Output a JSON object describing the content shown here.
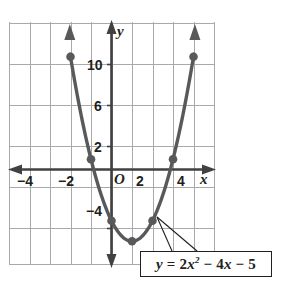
{
  "figure": {
    "kind": "coordinate-plane-graph",
    "background_color": "#ffffff",
    "grid_color": "#a7a9ac",
    "axis_color": "#414042",
    "curve_color": "#58595b",
    "point_color": "#58595b",
    "label_color": "#231f20"
  },
  "axes": {
    "x_axis_name": "x",
    "y_axis_name": "y",
    "origin_label": "O",
    "x_ticks": [
      {
        "label": "−4",
        "value": -4
      },
      {
        "label": "−2",
        "value": -2
      },
      {
        "label": "2",
        "value": 2
      },
      {
        "label": "4",
        "value": 4
      }
    ],
    "y_ticks": [
      {
        "label": "10",
        "value": 10
      },
      {
        "label": "6",
        "value": 6
      },
      {
        "label": "2",
        "value": 2
      },
      {
        "label": "−4",
        "value": -4
      }
    ]
  },
  "callout": {
    "equation_plain": "y = 2x² − 4x − 5",
    "lhs": "y",
    "equals": "=",
    "coef_a": "2",
    "var_x": "x",
    "exponent": "2",
    "minus_one": "−",
    "coef_b": "4",
    "var_x2": "x",
    "minus_two": "−",
    "constant": "5"
  },
  "chart_data": {
    "type": "line",
    "title": "",
    "xlabel": "x",
    "ylabel": "y",
    "xlim": [
      -5,
      5
    ],
    "ylim": [
      -8,
      12
    ],
    "grid": true,
    "legend": "none",
    "annotations": [
      {
        "text": "y = 2x² − 4x − 5",
        "kind": "equation-callout-box",
        "points_to": [
          [
            2.25,
            -5.2
          ],
          [
            2.25,
            -5.2
          ]
        ]
      }
    ],
    "series": [
      {
        "name": "y = 2x² − 4x − 5",
        "type": "parabola",
        "equation": "y = 2x^2 - 4x - 5",
        "a": 2,
        "b": -4,
        "c": -5,
        "vertex": [
          1,
          -7
        ],
        "x": [
          -2,
          -1,
          0,
          1,
          2,
          3,
          4
        ],
        "values": [
          11,
          1,
          -5,
          -7,
          -5,
          1,
          11
        ],
        "marked_points": [
          [
            -2,
            11
          ],
          [
            -1,
            1
          ],
          [
            0,
            -5
          ],
          [
            1,
            -7
          ],
          [
            2,
            -5
          ],
          [
            3,
            1
          ],
          [
            4,
            11
          ]
        ],
        "arrow_ends": [
          "both"
        ]
      }
    ],
    "x_tick_labels": [
      "−4",
      "−2",
      "2",
      "4"
    ],
    "y_tick_labels": [
      "10",
      "6",
      "2",
      "−4"
    ]
  }
}
